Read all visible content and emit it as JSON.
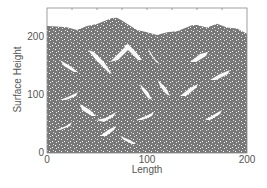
{
  "chart_data": {
    "type": "scatter",
    "subtype": "ballistic-deposition-surface",
    "title": "",
    "xlabel": "Length",
    "ylabel": "Surface Height",
    "xlim": [
      0,
      200
    ],
    "ylim": [
      0,
      240
    ],
    "x_ticks": [
      0,
      100,
      200
    ],
    "y_ticks": [
      0,
      100,
      200
    ],
    "x_tick_labels": [
      "0",
      "100",
      "200"
    ],
    "y_tick_labels": [
      "0",
      "100",
      "200"
    ],
    "grid": false,
    "legend": null,
    "deposit_color": "#787878",
    "surface_profile": {
      "x": [
        0,
        10,
        20,
        30,
        40,
        50,
        60,
        65,
        70,
        75,
        80,
        90,
        100,
        110,
        120,
        130,
        140,
        145,
        150,
        160,
        170,
        180,
        190,
        200
      ],
      "y": [
        210,
        212,
        208,
        206,
        210,
        216,
        220,
        226,
        224,
        222,
        214,
        206,
        200,
        198,
        200,
        204,
        208,
        214,
        212,
        210,
        214,
        210,
        206,
        200
      ]
    }
  },
  "axes": {
    "x_label": "Length",
    "y_label": "Surface Height",
    "x_ticks": [
      "0",
      "100",
      "200"
    ],
    "y_ticks": [
      "0",
      "100",
      "200"
    ]
  }
}
